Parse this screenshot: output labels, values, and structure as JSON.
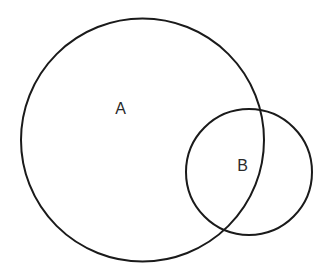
{
  "diagram": {
    "type": "venn",
    "sets": [
      {
        "id": "A",
        "label": "A"
      },
      {
        "id": "B",
        "label": "B"
      }
    ],
    "relationship": "B partially overlaps A",
    "colors": {
      "stroke": "#1a1a1a",
      "background": "#ffffff",
      "text": "#2a2a2a"
    }
  }
}
